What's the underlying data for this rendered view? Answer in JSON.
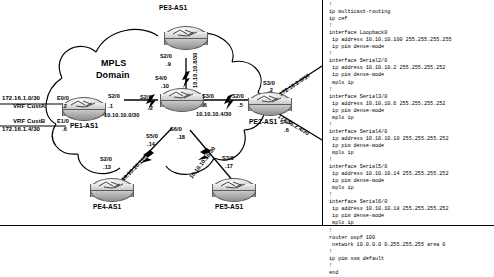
{
  "diagram": {
    "cloud_label_line1": "MPLS",
    "cloud_label_line2": "Domain",
    "routers": [
      {
        "id": "pe3",
        "name": "PE3-AS1"
      },
      {
        "id": "p",
        "name": ""
      },
      {
        "id": "pe1",
        "name": "PE1-AS1"
      },
      {
        "id": "pe2",
        "name": "PE2-AS1"
      },
      {
        "id": "pe4",
        "name": "PE4-AS1"
      },
      {
        "id": "pe5",
        "name": "PE5-AS1"
      }
    ],
    "customer_labels": [
      {
        "net": "172.16.1.0/30",
        "vrf": "VRF CustA",
        "intf": "E0/0",
        "host": ".2"
      },
      {
        "net": "172.16.1.4/30",
        "vrf": "VRF CustB",
        "intf": "E1/0",
        "host": ".6"
      }
    ],
    "interfaces": [
      {
        "intf": "S2/0",
        "host": ".9"
      },
      {
        "intf": "S4/0",
        "host": ".10"
      },
      {
        "intf": "S2/0",
        "host": ".1"
      },
      {
        "intf": "S2/0",
        "host": ".2"
      },
      {
        "intf": "S3/0",
        "host": ".6"
      },
      {
        "intf": "S2/0",
        "host": ".5"
      },
      {
        "intf": "S3/0",
        "host": ".2"
      },
      {
        "intf": "S4/0",
        "host": ".6"
      },
      {
        "intf": "S5/0",
        "host": ".14"
      },
      {
        "intf": "S6/0",
        "host": ".18"
      },
      {
        "intf": "S2/0",
        "host": ".13"
      },
      {
        "intf": "S3/0",
        "host": ".17"
      }
    ],
    "links": [
      {
        "net": "10.10.10.8/30"
      },
      {
        "net": "10.10.10.0/30"
      },
      {
        "net": "10.10.10.4/30"
      },
      {
        "net": "10.10.10.12/30"
      },
      {
        "net": "10.10.10.16/30"
      },
      {
        "net": "172.16.2.0/30"
      },
      {
        "net": "172.16.2.4/30"
      }
    ]
  },
  "config": {
    "text": "!\nip multicast-routing\nip cef\n!\ninterface Loopback0\n ip address 10.10.10.100 255.255.255.255\n ip pim dense-mode\n!\ninterface Serial2/0\n ip address 10.10.10.2 255.255.255.252\n ip pim dense-mode\n mpls ip\n!\ninterface Serial3/0\n ip address 10.10.10.6 255.255.255.252\n ip pim dense-mode\n mpls ip\n!\ninterface Serial4/0\n ip address 10.10.10.10 255.255.255.252\n ip pim dense-mode\n mpls ip\n!\ninterface Serial5/0\n ip address 10.10.10.14 255.255.255.252\n ip pim dense-mode\n mpls ip\n!\ninterface Serial6/0\n ip address 10.10.10.18 255.255.255.252\n ip pim dense-mode\n mpls ip\n!\nrouter ospf 100\n network 10.0.0.0 0.255.255.255 area 0\n!\nip pim ssm default\n!\nend"
  }
}
